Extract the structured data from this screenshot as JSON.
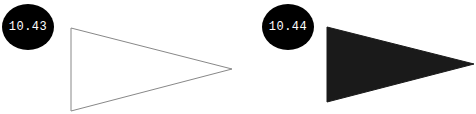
{
  "figures": [
    {
      "label": "10.43",
      "badge_color": "#000000",
      "badge_text_color": "#ffffff",
      "triangle": {
        "style": "outline",
        "stroke": "#888888",
        "fill": "none",
        "points": "71,28 71,111 232,69"
      }
    },
    {
      "label": "10.44",
      "badge_color": "#000000",
      "badge_text_color": "#ffffff",
      "triangle": {
        "style": "filled",
        "stroke": "#1a1a1a",
        "fill": "#1a1a1a",
        "points": "327,27 327,102 474,64"
      }
    }
  ]
}
